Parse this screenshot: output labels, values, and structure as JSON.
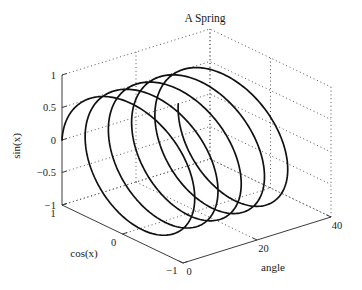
{
  "figure": {
    "background": "#ffffff",
    "curve_color": "#111111",
    "grid_color": "#555555",
    "axis_color": "#3c3c3c"
  },
  "chart_data": {
    "type": "line",
    "subtype": "parametric-3d-helix",
    "title": "A Spring",
    "xlabel": "cos(x)",
    "ylabel": "angle",
    "zlabel": "sin(x)",
    "xlim": [
      -1,
      1
    ],
    "ylim": [
      0,
      40
    ],
    "zlim": [
      -1,
      1
    ],
    "xticks": {
      "values": [
        1,
        0,
        -1
      ],
      "labels": [
        "1",
        "0",
        "−1"
      ]
    },
    "yticks": {
      "values": [
        0,
        20,
        40
      ],
      "labels": [
        "0",
        "20",
        "40"
      ]
    },
    "zticks": {
      "values": [
        1,
        0.5,
        0,
        -0.5,
        -1
      ],
      "labels": [
        "1",
        "0.5",
        "0",
        "−0.5",
        "−1"
      ]
    },
    "grid": "dotted-box",
    "legend": "none",
    "curve": {
      "x_expr": "cos(t)",
      "y_expr": "t",
      "z_expr": "sin(t)",
      "t_min": 0,
      "t_max": 31.41592653589793,
      "turns": 5,
      "samples": 900,
      "color": "#111111",
      "width": 1.7
    }
  }
}
